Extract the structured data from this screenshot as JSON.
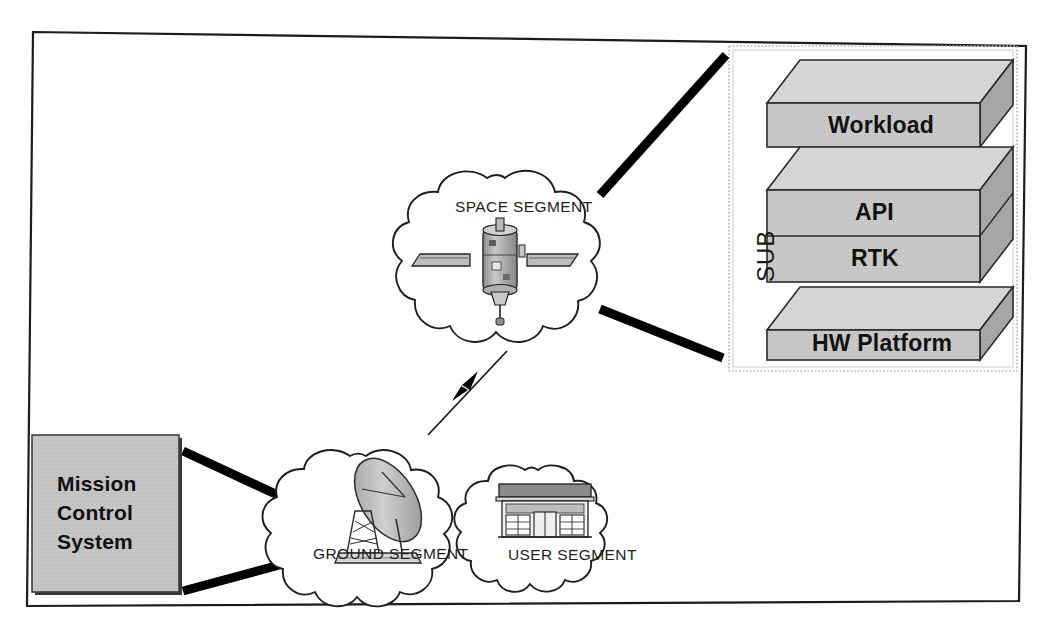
{
  "diagram": {
    "frame": {
      "name": "outer-slide-border",
      "style": "thin-black-rectangle-slightly-rotated"
    },
    "colors": {
      "box_fill": "#c9c9c9",
      "box_top_face": "#d9d9d9",
      "box_side_face": "#a9a9a9",
      "outline": "#1a1a1a",
      "connector": "#000000",
      "panel_border": "#b5b5b5",
      "mcs_fill": "#c4c4c4",
      "background": "#ffffff"
    },
    "clouds": [
      {
        "id": "space",
        "label": "SPACE SEGMENT",
        "icon": "satellite-icon"
      },
      {
        "id": "ground",
        "label": "GROUND SEGMENT",
        "icon": "satellite-dish-icon"
      },
      {
        "id": "user",
        "label": "USER SEGMENT",
        "icon": "building-storefront-icon"
      }
    ],
    "mission_control": {
      "name": "mission-control-system-box",
      "lines": [
        "Mission",
        "Control",
        "System"
      ]
    },
    "sub_panel": {
      "name": "sub-panel",
      "side_label": "SUB",
      "stack": [
        {
          "id": "workload",
          "label": "Workload",
          "rows": [
            "Workload"
          ]
        },
        {
          "id": "api-rtk",
          "label": "API / RTK",
          "rows": [
            "API",
            "RTK"
          ]
        },
        {
          "id": "hw-platform",
          "label": "HW Platform",
          "rows": [
            "HW Platform"
          ]
        }
      ]
    },
    "connectors": [
      {
        "id": "space-to-sub-upper",
        "from": "space-segment",
        "to": "sub-panel",
        "style": "thick-solid"
      },
      {
        "id": "space-to-sub-lower",
        "from": "space-segment",
        "to": "sub-panel",
        "style": "thick-solid"
      },
      {
        "id": "space-to-ground",
        "from": "space-segment",
        "to": "ground-segment",
        "style": "thin-rf-link",
        "symbol": "lightning-bolt-icon"
      },
      {
        "id": "mcs-to-ground-upper",
        "from": "mission-control",
        "to": "ground-segment",
        "style": "thick-solid"
      },
      {
        "id": "mcs-to-ground-lower",
        "from": "mission-control",
        "to": "ground-segment",
        "style": "thick-solid"
      }
    ]
  }
}
